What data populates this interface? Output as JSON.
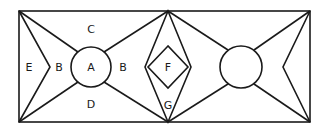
{
  "diagram": {
    "type": "geometric-region-figure",
    "labels": {
      "A": "A",
      "B_left": "B",
      "B_right": "B",
      "C": "C",
      "D": "D",
      "E": "E",
      "F": "F",
      "G": "G"
    },
    "stroke_color": "#1a1a1a",
    "background_color": "#ffffff"
  }
}
